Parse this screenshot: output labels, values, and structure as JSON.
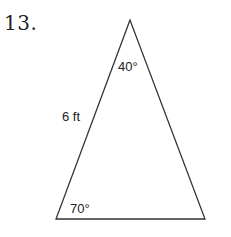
{
  "problem": {
    "number": "13."
  },
  "triangle": {
    "vertices": {
      "apex": [
        130,
        20
      ],
      "bottom_left": [
        56,
        219
      ],
      "bottom_right": [
        205,
        219
      ]
    },
    "labels": {
      "apex_angle": "40°",
      "left_side": "6 ft",
      "bottom_left_angle": "70°"
    },
    "stroke_color": "#333333"
  }
}
